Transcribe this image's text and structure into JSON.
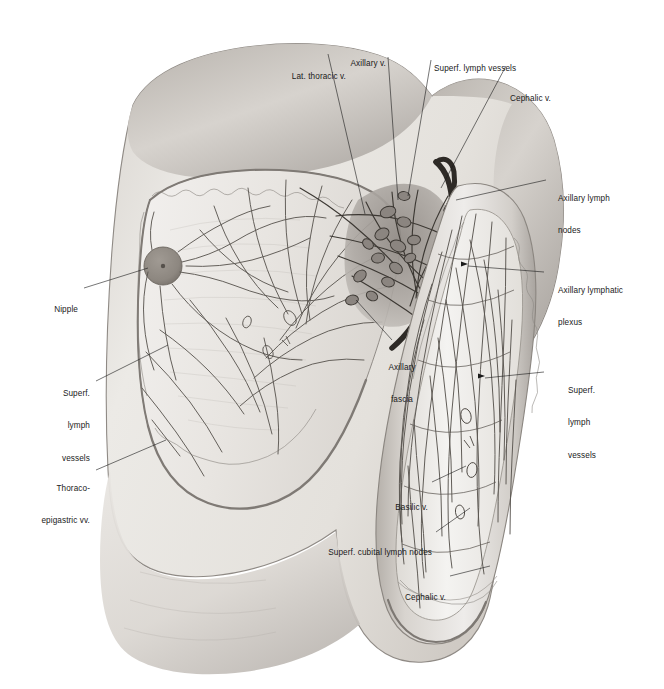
{
  "figure": {
    "type": "anatomical-illustration",
    "style": "grayscale pencil/wash medical plate",
    "background_color": "#ffffff",
    "ink_color": "#1a1a1a",
    "skin_tone_light": "#eceae7",
    "skin_tone_mid": "#cfcbc6",
    "skin_tone_dark": "#9d9894",
    "nipple_color": "#8e8882"
  },
  "labels": [
    {
      "id": "lat-thoracic-v",
      "text": "Lat. thoracic v.",
      "lines": [
        "Lat. thoracic v."
      ],
      "align": "right"
    },
    {
      "id": "axillary-v",
      "text": "Axillary v.",
      "lines": [
        "Axillary v."
      ],
      "align": "right"
    },
    {
      "id": "superf-lymph-top",
      "text": "Superf. lymph vessels",
      "lines": [
        "Superf. lymph vessels"
      ],
      "align": "left"
    },
    {
      "id": "cephalic-v-top",
      "text": "Cephalic v.",
      "lines": [
        "Cephalic v."
      ],
      "align": "left"
    },
    {
      "id": "axillary-lymph-nodes",
      "text": "Axillary lymph nodes",
      "lines": [
        "Axillary lymph",
        "nodes"
      ],
      "align": "left"
    },
    {
      "id": "axillary-lymphatic-plexus",
      "text": "Axillary lymphatic plexus",
      "lines": [
        "Axillary lymphatic",
        "plexus"
      ],
      "align": "left"
    },
    {
      "id": "superf-lymph-right",
      "text": "Superf. lymph vessels",
      "lines": [
        "Superf.",
        "lymph",
        "vessels"
      ],
      "align": "left"
    },
    {
      "id": "nipple",
      "text": "Nipple",
      "lines": [
        "Nipple"
      ],
      "align": "right"
    },
    {
      "id": "superf-lymph-left",
      "text": "Superf. lymph vessels",
      "lines": [
        "Superf.",
        "lymph",
        "vessels"
      ],
      "align": "right"
    },
    {
      "id": "thoraco-epigastric-vv",
      "text": "Thoraco-epigastric vv.",
      "lines": [
        "Thoraco-",
        "epigastric vv."
      ],
      "align": "right"
    },
    {
      "id": "axillary-fascia",
      "text": "Axillary fascia",
      "lines": [
        "Axillary",
        "fascia"
      ],
      "align": "center"
    },
    {
      "id": "basilic-v",
      "text": "Basilic v.",
      "lines": [
        "Basilic v."
      ],
      "align": "right"
    },
    {
      "id": "superf-cubital-nodes",
      "text": "Superf. cubital lymph nodes",
      "lines": [
        "Superf. cubital lymph nodes"
      ],
      "align": "right"
    },
    {
      "id": "cephalic-v-bottom",
      "text": "Cephalic v.",
      "lines": [
        "Cephalic v."
      ],
      "align": "right"
    }
  ]
}
